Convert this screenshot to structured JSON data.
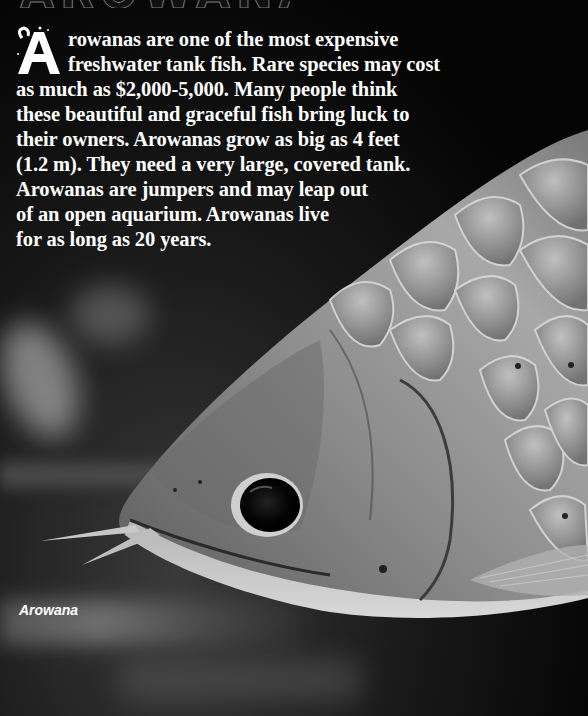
{
  "page": {
    "title_remnant": "AROWANAS",
    "drop_cap": "A",
    "body_lines": [
      "rowanas are one of the most expensive",
      "freshwater tank fish. Rare species may cost",
      "as much as $2,000-5,000. Many people think",
      "these beautiful and graceful fish bring luck to",
      "their owners. Arowanas grow as big as 4 feet",
      "(1.2 m). They need a very large, covered tank.",
      "Arowanas are jumpers and may leap out",
      "of an open aquarium. Arowanas live",
      "for as long as 20 years."
    ],
    "caption": "Arowana",
    "photo_subject": "arowana-fish-head"
  },
  "colors": {
    "text": "#ffffff",
    "background": "#000000"
  }
}
